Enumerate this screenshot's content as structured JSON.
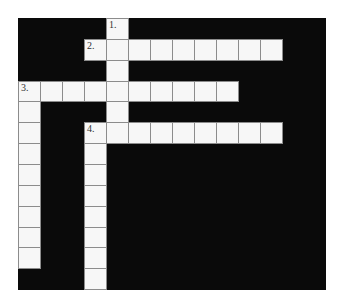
{
  "puzzle": {
    "type": "crossword",
    "grid": {
      "cols": 14,
      "rows": 13
    },
    "colors": {
      "block": "#0a0a0a",
      "cell": "#f7f7f7",
      "cell_border": "#8c8c8c",
      "background": "#ffffff"
    },
    "entries": [
      {
        "number": "1.",
        "label": "1.",
        "direction": "down",
        "row": 0,
        "col": 4,
        "length": 6
      },
      {
        "number": "2.",
        "label": "2.",
        "direction": "across",
        "row": 1,
        "col": 3,
        "length": 9
      },
      {
        "number": "3.",
        "label": "3.",
        "direction": "across",
        "row": 3,
        "col": 0,
        "length": 10
      },
      {
        "number": "3.",
        "label": "",
        "direction": "down",
        "row": 3,
        "col": 0,
        "length": 9
      },
      {
        "number": "4.",
        "label": "4.",
        "direction": "across",
        "row": 5,
        "col": 3,
        "length": 9
      },
      {
        "number": "4.",
        "label": "",
        "direction": "down",
        "row": 5,
        "col": 3,
        "length": 8
      }
    ]
  }
}
